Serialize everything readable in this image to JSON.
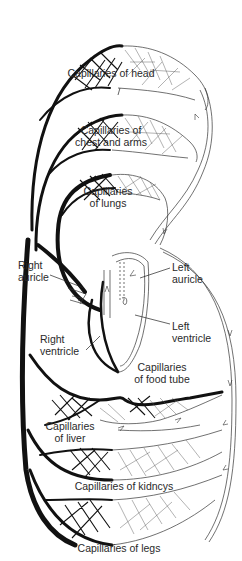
{
  "figure": {
    "colors": {
      "background": "#ffffff",
      "deoxygenated_vessels": "#111111",
      "oxygenated_vessels": "#ffffff",
      "outline": "#333333",
      "label_text": "#2a2a2a"
    }
  },
  "labels": {
    "head": [
      "Capillaries of head"
    ],
    "chest_arms": [
      "Capillaries of",
      "chest and arms"
    ],
    "lungs": [
      "Capillaries",
      "of lungs"
    ],
    "right_auricle": [
      "Right",
      "auricle"
    ],
    "left_auricle": [
      "Left",
      "auricle"
    ],
    "left_ventricle": [
      "Left",
      "ventricle"
    ],
    "right_ventricle": [
      "Right",
      "ventricle"
    ],
    "food_tube": [
      "Capillaries",
      "of food tube"
    ],
    "liver": [
      "Capillaries",
      "of liver"
    ],
    "kidneys": [
      "Capillaries of kidncys"
    ],
    "legs": [
      "Capillaries of legs"
    ]
  }
}
